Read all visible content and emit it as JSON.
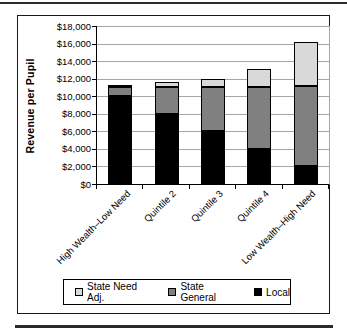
{
  "chart_data": {
    "type": "bar",
    "stacked": true,
    "title": "",
    "xlabel": "",
    "ylabel": "Revenue per Pupil",
    "ylim": [
      0,
      18000
    ],
    "ytick_step": 2000,
    "ytick_labels": [
      "$0",
      "$2,000",
      "$4,000",
      "$6,000",
      "$8,000",
      "$10,000",
      "$12,000",
      "$14,000",
      "$16,000",
      "$18,000"
    ],
    "categories": [
      "High Wealth–Low Need",
      "Quintile 2",
      "Quintile 3",
      "Quintile 4",
      "Low Wealth–High Need"
    ],
    "series": [
      {
        "name": "Local",
        "color": "#000000",
        "values": [
          10000,
          8000,
          6000,
          4000,
          2100
        ]
      },
      {
        "name": "State General",
        "color": "#808080",
        "values": [
          1100,
          3100,
          5100,
          7100,
          9100
        ]
      },
      {
        "name": "State Need Adj.",
        "color": "#d9d9d9",
        "values": [
          100,
          500,
          900,
          2000,
          5000
        ]
      }
    ],
    "totals": [
      11200,
      11600,
      12000,
      13100,
      16200
    ],
    "legend": {
      "position": "bottom",
      "entries": [
        "State Need Adj.",
        "State General",
        "Local"
      ]
    },
    "grid": true,
    "gridline_color": "#a6a6a6"
  }
}
